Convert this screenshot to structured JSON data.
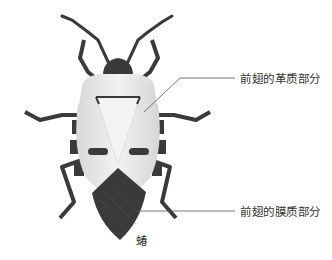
{
  "diagram": {
    "subject": "蝽",
    "labels": [
      {
        "id": "leathery",
        "text": "前翅的革质部分"
      },
      {
        "id": "membranous",
        "text": "前翅的膜质部分"
      }
    ],
    "caption": "蝽",
    "colors": {
      "dark": "#3a3a3a",
      "light": "#e6e6e6",
      "leader": "#555555"
    }
  }
}
